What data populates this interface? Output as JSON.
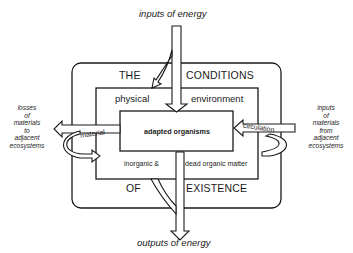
{
  "diagram": {
    "top_label": "inputs of energy",
    "bottom_label": "outputs of energy",
    "outer_box": {
      "top_left": "THE",
      "top_right": "CONDITIONS",
      "bottom_left": "OF",
      "bottom_right": "EXISTENCE"
    },
    "middle_box": {
      "top_left": "physical",
      "top_right": "environment",
      "bottom_left": "inorganic &",
      "bottom_right": "dead organic matter"
    },
    "inner_box": {
      "label": "adapted organisms"
    },
    "left_arrow_label": "material",
    "right_arrow_label": "circulation",
    "left_side": {
      "lines": [
        "losses",
        "of",
        "materials",
        "to",
        "adjacent",
        "ecosystems"
      ]
    },
    "right_side": {
      "lines": [
        "inputs",
        "of",
        "materials",
        "from",
        "adjacent",
        "ecosystems"
      ]
    },
    "colors": {
      "line": "#1a1a1a",
      "background": "#ffffff"
    }
  }
}
